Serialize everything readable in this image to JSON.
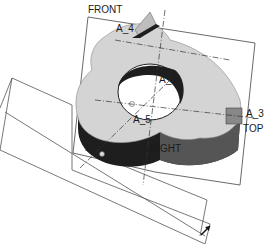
{
  "viewport": {
    "background": "#ffffff",
    "part_color": "#d4d4d4",
    "side_color": "#1e1e1e",
    "side_gray": "#555555",
    "line_color": "#333333"
  },
  "datum_planes": {
    "front": "FRONT",
    "top": "TOP",
    "right": "RIGHT"
  },
  "datum_axes": {
    "a1": "A_1",
    "a3": "A_3",
    "a4": "A_4",
    "a5": "A_5"
  }
}
